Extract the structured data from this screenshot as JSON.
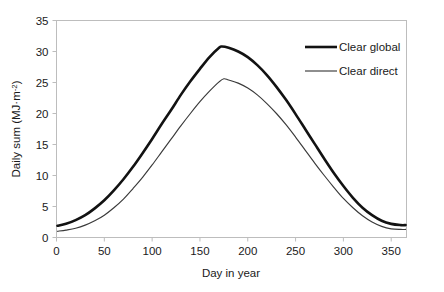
{
  "chart_data": {
    "type": "line",
    "title": "",
    "xlabel": "Day in year",
    "ylabel": "Daily sum (MJ·m-2)",
    "ylabel_main": "Daily sum (MJ·m",
    "ylabel_sup": "-2",
    "ylabel_tail": ")",
    "xlim": [
      0,
      366
    ],
    "ylim": [
      0,
      35
    ],
    "xticks": [
      0,
      50,
      100,
      150,
      200,
      250,
      300,
      350
    ],
    "yticks": [
      0,
      5,
      10,
      15,
      20,
      25,
      30,
      35
    ],
    "xticklabels": [
      "0",
      "50",
      "100",
      "150",
      "200",
      "250",
      "300",
      "350"
    ],
    "yticklabels": [
      "0",
      "5",
      "10",
      "15",
      "20",
      "25",
      "30",
      "35"
    ],
    "grid": false,
    "legend_position": "upper right",
    "series": [
      {
        "name": "Clear global",
        "color": "#121212",
        "linewidth": 2.6,
        "x": [
          1,
          10,
          20,
          30,
          40,
          50,
          60,
          70,
          80,
          90,
          100,
          110,
          120,
          130,
          140,
          150,
          160,
          170,
          173,
          180,
          190,
          200,
          210,
          220,
          230,
          240,
          250,
          260,
          270,
          280,
          290,
          300,
          310,
          320,
          330,
          340,
          350,
          360,
          365
        ],
        "values": [
          1.9,
          2.2,
          2.8,
          3.6,
          4.7,
          6.0,
          7.6,
          9.4,
          11.4,
          13.6,
          15.9,
          18.3,
          20.6,
          23.0,
          25.2,
          27.2,
          29.1,
          30.6,
          30.8,
          30.6,
          30.0,
          29.1,
          27.8,
          26.2,
          24.3,
          22.2,
          19.9,
          17.5,
          15.1,
          12.7,
          10.4,
          8.3,
          6.4,
          4.8,
          3.6,
          2.7,
          2.2,
          2.0,
          2.0
        ]
      },
      {
        "name": "Clear direct",
        "color": "#3a3a3a",
        "linewidth": 1.15,
        "x": [
          1,
          10,
          20,
          30,
          40,
          50,
          60,
          70,
          80,
          90,
          100,
          110,
          120,
          130,
          140,
          150,
          160,
          170,
          175,
          180,
          190,
          200,
          210,
          220,
          230,
          240,
          250,
          260,
          270,
          280,
          290,
          300,
          310,
          320,
          330,
          340,
          350,
          360,
          365
        ],
        "values": [
          1.0,
          1.2,
          1.5,
          2.0,
          2.7,
          3.6,
          4.8,
          6.2,
          7.9,
          9.7,
          11.7,
          13.8,
          15.9,
          18.0,
          20.0,
          21.9,
          23.6,
          25.1,
          25.6,
          25.4,
          24.9,
          24.1,
          23.0,
          21.6,
          20.0,
          18.2,
          16.2,
          14.1,
          12.0,
          10.0,
          8.1,
          6.3,
          4.8,
          3.5,
          2.5,
          1.8,
          1.4,
          1.3,
          1.3
        ]
      }
    ],
    "legend": [
      {
        "label": "Clear global",
        "color": "#121212",
        "linewidth": 2.6
      },
      {
        "label": "Clear direct",
        "color": "#3a3a3a",
        "linewidth": 1.15
      }
    ]
  }
}
